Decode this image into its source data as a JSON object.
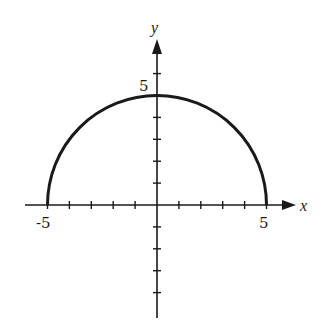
{
  "chart_data": {
    "type": "line",
    "title": "",
    "xlabel": "x",
    "ylabel": "y",
    "xlim": [
      -7,
      6.5
    ],
    "ylim": [
      -5,
      8
    ],
    "grid": false,
    "legend": null,
    "tick_labels": {
      "x": [
        {
          "value": -5,
          "label": "-5"
        },
        {
          "value": 5,
          "label": "5"
        }
      ],
      "y": [
        {
          "value": 5,
          "label": "5"
        }
      ]
    },
    "x_ticks": [
      -5,
      -4,
      -3,
      -2,
      -1,
      1,
      2,
      3,
      4,
      5
    ],
    "y_ticks": [
      -4,
      -3,
      -2,
      -1,
      1,
      2,
      3,
      4,
      5,
      6
    ],
    "series": [
      {
        "name": "semicircle",
        "x": [
          -5,
          -4,
          -3,
          -2,
          -1,
          0,
          1,
          2,
          3,
          4,
          5
        ],
        "y": [
          0,
          3,
          4,
          4.58,
          4.9,
          5,
          4.9,
          4.58,
          4,
          3,
          0
        ]
      }
    ]
  },
  "labels": {
    "x_axis": "x",
    "y_axis": "y",
    "x_neg5": "-5",
    "x_pos5": "5",
    "y_pos5": "5"
  },
  "colors": {
    "ink": "#1a1a1a",
    "background": "#ffffff"
  }
}
